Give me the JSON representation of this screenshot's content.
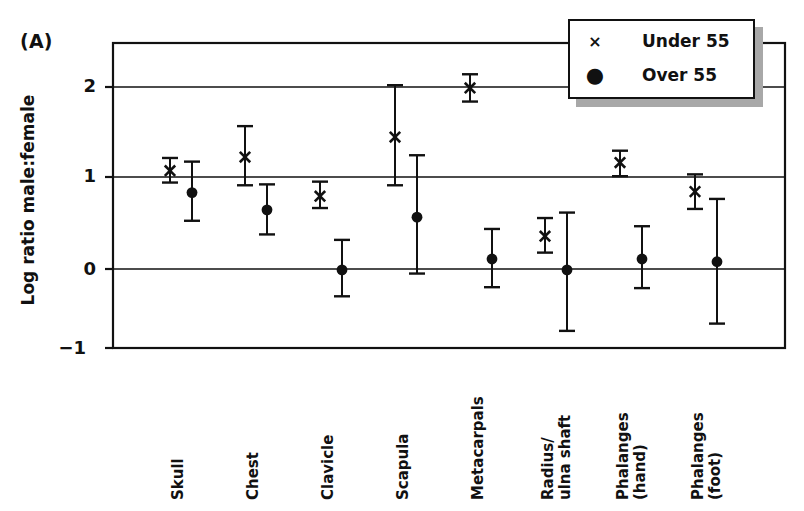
{
  "panel": {
    "label": "(A)"
  },
  "legend": {
    "position": "top-right",
    "items": [
      {
        "marker": "x-marker-icon",
        "glyph": "×",
        "label": "Under 55"
      },
      {
        "marker": "filled-circle-marker-icon",
        "glyph": "●",
        "label": "Over 55"
      }
    ]
  },
  "axes": {
    "ylabel": "Log ratio male:female",
    "yticks": [
      "2",
      "1",
      "0",
      "−1"
    ],
    "ytick_values": [
      2,
      1,
      0,
      -1
    ],
    "ylim": [
      -1,
      2.45
    ],
    "grid": true
  },
  "chart_data": {
    "type": "scatter",
    "title": "",
    "xlabel": "",
    "ylabel": "Log ratio male:female",
    "ylim": [
      -1,
      2.45
    ],
    "yticks": [
      -1,
      0,
      1,
      2
    ],
    "grid": true,
    "legend_position": "top-right",
    "error_bars": "vertical",
    "categories": [
      "Skull",
      "Chest",
      "Clavicle",
      "Scapula",
      "Metacarpals",
      "Radius/\nulna shaft",
      "Phalanges\n(hand)",
      "Phalanges\n(foot)"
    ],
    "series": [
      {
        "name": "Under 55",
        "marker": "x",
        "values": [
          1.08,
          1.23,
          0.8,
          1.45,
          1.99,
          0.36,
          1.17,
          0.85
        ],
        "err_low": [
          0.95,
          0.92,
          0.67,
          0.92,
          1.84,
          0.18,
          1.02,
          0.66
        ],
        "err_high": [
          1.22,
          1.57,
          0.96,
          2.02,
          2.14,
          0.56,
          1.3,
          1.04
        ]
      },
      {
        "name": "Over 55",
        "marker": "circle",
        "values": [
          0.84,
          0.65,
          -0.01,
          0.57,
          0.11,
          -0.01,
          0.11,
          0.08
        ],
        "err_low": [
          0.53,
          0.38,
          -0.3,
          -0.05,
          -0.2,
          -0.68,
          -0.21,
          -0.6
        ],
        "err_high": [
          1.18,
          0.93,
          0.32,
          1.25,
          0.44,
          0.62,
          0.47,
          0.77
        ]
      }
    ]
  }
}
